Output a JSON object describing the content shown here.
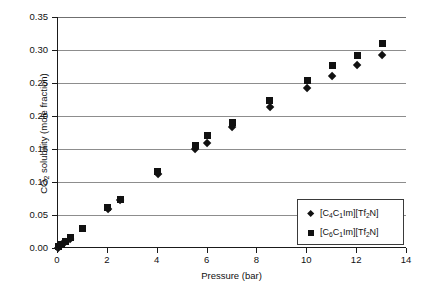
{
  "chart_data": {
    "type": "scatter",
    "title": "",
    "xlabel": "Pressure (bar)",
    "ylabel": "CO2 solubility (mole fraction)",
    "ylabel_parts": {
      "pre": "CO",
      "sub": "2",
      "post": " solubility (mole fraction)"
    },
    "xlim": [
      0,
      14
    ],
    "ylim": [
      0,
      0.35
    ],
    "xticks": [
      0,
      2,
      4,
      6,
      8,
      10,
      12,
      14
    ],
    "xtick_labels": [
      "0",
      "2",
      "4",
      "6",
      "8",
      "10",
      "12",
      "14"
    ],
    "yticks": [
      0.0,
      0.05,
      0.1,
      0.15,
      0.2,
      0.25,
      0.3,
      0.35
    ],
    "ytick_labels": [
      "0.00",
      "0.05",
      "0.10",
      "0.15",
      "0.20",
      "0.25",
      "0.30",
      "0.35"
    ],
    "grid": {
      "horizontal": true,
      "vertical": false
    },
    "legend_position": "lower right",
    "marker_color": "#111111",
    "series": [
      {
        "name": "[C4C1Im][Tf2N]",
        "name_parts": [
          {
            "t": "[C",
            "sub": false
          },
          {
            "t": "4",
            "sub": true
          },
          {
            "t": "C",
            "sub": false
          },
          {
            "t": "1",
            "sub": true
          },
          {
            "t": "Im][Tf",
            "sub": false
          },
          {
            "t": "2",
            "sub": true
          },
          {
            "t": "N]",
            "sub": false
          }
        ],
        "marker": "diamond",
        "points": [
          {
            "x": 0.0,
            "y": 0.0
          },
          {
            "x": 0.1,
            "y": 0.004
          },
          {
            "x": 0.2,
            "y": 0.007
          },
          {
            "x": 0.3,
            "y": 0.009
          },
          {
            "x": 0.5,
            "y": 0.014
          },
          {
            "x": 2.0,
            "y": 0.059
          },
          {
            "x": 2.5,
            "y": 0.073
          },
          {
            "x": 4.0,
            "y": 0.112
          },
          {
            "x": 5.5,
            "y": 0.15
          },
          {
            "x": 6.0,
            "y": 0.159
          },
          {
            "x": 7.0,
            "y": 0.183
          },
          {
            "x": 8.5,
            "y": 0.213
          },
          {
            "x": 10.0,
            "y": 0.242
          },
          {
            "x": 11.0,
            "y": 0.26
          },
          {
            "x": 12.0,
            "y": 0.277
          },
          {
            "x": 13.0,
            "y": 0.293
          }
        ]
      },
      {
        "name": "[C6C1Im][Tf2N]",
        "name_parts": [
          {
            "t": "[C",
            "sub": false
          },
          {
            "t": "6",
            "sub": true
          },
          {
            "t": "C",
            "sub": false
          },
          {
            "t": "1",
            "sub": true
          },
          {
            "t": "Im][Tf",
            "sub": false
          },
          {
            "t": "2",
            "sub": true
          },
          {
            "t": "N]",
            "sub": false
          }
        ],
        "marker": "square",
        "points": [
          {
            "x": 0.0,
            "y": 0.002
          },
          {
            "x": 0.15,
            "y": 0.006
          },
          {
            "x": 0.3,
            "y": 0.01
          },
          {
            "x": 0.5,
            "y": 0.016
          },
          {
            "x": 1.0,
            "y": 0.03
          },
          {
            "x": 2.0,
            "y": 0.062
          },
          {
            "x": 2.5,
            "y": 0.074
          },
          {
            "x": 4.0,
            "y": 0.116
          },
          {
            "x": 5.5,
            "y": 0.155
          },
          {
            "x": 6.0,
            "y": 0.171
          },
          {
            "x": 7.0,
            "y": 0.19
          },
          {
            "x": 8.5,
            "y": 0.223
          },
          {
            "x": 10.0,
            "y": 0.254
          },
          {
            "x": 11.0,
            "y": 0.276
          },
          {
            "x": 12.0,
            "y": 0.292
          },
          {
            "x": 13.0,
            "y": 0.31
          }
        ]
      }
    ]
  }
}
